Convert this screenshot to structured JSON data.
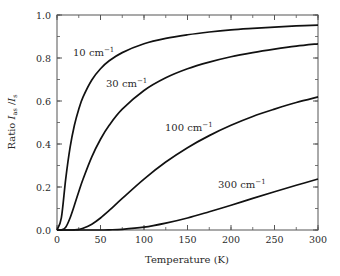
{
  "chart_data": {
    "type": "line",
    "title": "",
    "xlabel": "Temperature (K)",
    "ylabel": "Ratio I_as / I_s",
    "ylabel_parts": {
      "prefix": "Ratio ",
      "num": "I",
      "num_sub": "as",
      "sep": " /",
      "den": "I",
      "den_sub": "s"
    },
    "xlim": [
      0,
      300
    ],
    "ylim": [
      0.0,
      1.0
    ],
    "xticks": [
      0,
      50,
      100,
      150,
      200,
      250,
      300
    ],
    "xtick_labels": [
      "0",
      "50",
      "100",
      "150",
      "200",
      "250",
      "300"
    ],
    "xminor_step": 25,
    "yticks": [
      0.0,
      0.2,
      0.4,
      0.6,
      0.8,
      1.0
    ],
    "ytick_labels": [
      "0.0",
      "0.2",
      "0.4",
      "0.6",
      "0.8",
      "1.0"
    ],
    "yminor_step": 0.1,
    "grid": false,
    "legend": "inline labels",
    "x": [
      0,
      5,
      10,
      15,
      20,
      25,
      30,
      40,
      50,
      60,
      75,
      100,
      125,
      150,
      175,
      200,
      225,
      250,
      275,
      300
    ],
    "series": [
      {
        "name": "10 cm-1",
        "label": "10 cm",
        "sup": "−1",
        "label_pos": [
          73,
          56
        ],
        "values": [
          0.0,
          0.056,
          0.237,
          0.383,
          0.487,
          0.562,
          0.619,
          0.698,
          0.75,
          0.787,
          0.825,
          0.866,
          0.891,
          0.908,
          0.921,
          0.931,
          0.938,
          0.944,
          0.949,
          0.953
        ]
      },
      {
        "name": "30 cm-1",
        "label": "30 cm",
        "sup": "−1",
        "label_pos": [
          106,
          87
        ],
        "values": [
          0.0,
          0.0,
          0.013,
          0.056,
          0.115,
          0.178,
          0.237,
          0.34,
          0.422,
          0.487,
          0.562,
          0.649,
          0.708,
          0.75,
          0.781,
          0.806,
          0.825,
          0.841,
          0.855,
          0.866
        ]
      },
      {
        "name": "100 cm-1",
        "label": "100 cm",
        "sup": "−1",
        "label_pos": [
          165,
          131
        ],
        "values": [
          0.0,
          0.0,
          0.0,
          0.0,
          0.001,
          0.003,
          0.008,
          0.027,
          0.056,
          0.091,
          0.147,
          0.237,
          0.316,
          0.383,
          0.439,
          0.487,
          0.528,
          0.562,
          0.593,
          0.619
        ]
      },
      {
        "name": "300 cm-1",
        "label": "300 cm",
        "sup": "−1",
        "label_pos": [
          218,
          188
        ],
        "values": [
          0.0,
          0.0,
          0.0,
          0.0,
          0.0,
          0.0,
          0.0,
          0.0,
          0.0,
          0.001,
          0.003,
          0.013,
          0.032,
          0.056,
          0.085,
          0.115,
          0.147,
          0.178,
          0.208,
          0.237
        ]
      }
    ],
    "colors": {
      "line": "#111111",
      "axis": "#555555",
      "text": "#2a2a2a"
    }
  }
}
